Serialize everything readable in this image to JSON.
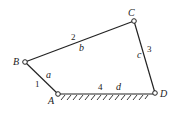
{
  "diagram": {
    "type": "four-bar-linkage",
    "joints": {
      "A": {
        "label": "A",
        "x": 58,
        "y": 94
      },
      "B": {
        "label": "B",
        "x": 25,
        "y": 62
      },
      "C": {
        "label": "C",
        "x": 134,
        "y": 21
      },
      "D": {
        "label": "D",
        "x": 155,
        "y": 93
      }
    },
    "links": [
      {
        "number": "1",
        "length_label": "a",
        "from": "A",
        "to": "B"
      },
      {
        "number": "2",
        "length_label": "b",
        "from": "B",
        "to": "C"
      },
      {
        "number": "3",
        "length_label": "c",
        "from": "C",
        "to": "D"
      },
      {
        "number": "4",
        "length_label": "d",
        "from": "A",
        "to": "D",
        "ground": true
      }
    ],
    "colors": {
      "stroke": "#222222",
      "background": "#ffffff"
    }
  }
}
